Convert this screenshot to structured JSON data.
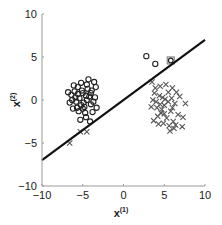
{
  "chart_data": {
    "type": "scatter",
    "title": "",
    "xlabel": "x(1)",
    "ylabel": "x(2)",
    "xlabel_base": "x",
    "xlabel_sup": "(1)",
    "ylabel_base": "x",
    "ylabel_sup": "(2)",
    "xlim": [
      -10,
      10
    ],
    "ylim": [
      -10,
      10
    ],
    "xticks": [
      -10,
      -5,
      0,
      5,
      10
    ],
    "yticks": [
      -10,
      -5,
      0,
      5,
      10
    ],
    "xtick_labels": [
      "−10",
      "−5",
      "0",
      "5",
      "10"
    ],
    "ytick_labels": [
      "−10",
      "−5",
      "0",
      "5",
      "10"
    ],
    "grid": false,
    "legend": null,
    "series": [
      {
        "name": "class-circle",
        "marker": "o",
        "color": "#222222",
        "center": [
          -5,
          0
        ],
        "points": [
          [
            -5.2,
            2.0
          ],
          [
            -6.4,
            0.6
          ],
          [
            -3.6,
            2.1
          ],
          [
            -4.5,
            1.8
          ],
          [
            -5.6,
            1.5
          ],
          [
            -3.9,
            1.1
          ],
          [
            -6.0,
            1.0
          ],
          [
            -4.2,
            0.4
          ],
          [
            -5.8,
            -0.2
          ],
          [
            -6.6,
            -0.3
          ],
          [
            -3.5,
            0.3
          ],
          [
            -4.8,
            -0.8
          ],
          [
            -5.5,
            -1.3
          ],
          [
            -4.0,
            -0.5
          ],
          [
            -6.2,
            -1.0
          ],
          [
            -5.0,
            0.8
          ],
          [
            -4.4,
            1.3
          ],
          [
            -5.9,
            0.3
          ],
          [
            -3.8,
            -1.4
          ],
          [
            -4.6,
            -2.0
          ],
          [
            -5.3,
            -2.3
          ],
          [
            -4.1,
            -2.5
          ],
          [
            -6.3,
            0.0
          ],
          [
            -3.4,
            1.5
          ],
          [
            -5.1,
            1.1
          ],
          [
            -4.7,
            -1.5
          ],
          [
            -5.7,
            -0.9
          ],
          [
            -4.3,
            2.4
          ],
          [
            -6.8,
            0.9
          ],
          [
            -3.7,
            -0.2
          ],
          [
            -5.4,
            0.2
          ],
          [
            -4.9,
            -0.3
          ],
          [
            -5.0,
            -1.0
          ],
          [
            -4.5,
            0.0
          ],
          [
            -5.6,
            0.7
          ],
          [
            -4.0,
            0.8
          ],
          [
            -5.2,
            -0.6
          ],
          [
            -4.6,
            0.5
          ],
          [
            -6.1,
            1.7
          ],
          [
            -3.3,
            -0.9
          ],
          [
            2.8,
            5.1
          ],
          [
            3.9,
            4.2
          ]
        ]
      },
      {
        "name": "class-cross",
        "marker": "x",
        "color": "#555555",
        "center": [
          5,
          -0.5
        ],
        "points": [
          [
            3.5,
            2.1
          ],
          [
            4.5,
            1.6
          ],
          [
            6.0,
            1.4
          ],
          [
            3.8,
            0.8
          ],
          [
            5.5,
            0.9
          ],
          [
            6.9,
            0.4
          ],
          [
            4.0,
            -0.2
          ],
          [
            5.1,
            0.1
          ],
          [
            6.3,
            -0.4
          ],
          [
            3.4,
            -0.8
          ],
          [
            4.7,
            -1.1
          ],
          [
            5.8,
            -1.3
          ],
          [
            6.7,
            -1.7
          ],
          [
            4.2,
            -1.9
          ],
          [
            5.3,
            -2.1
          ],
          [
            3.7,
            -2.4
          ],
          [
            4.9,
            -2.7
          ],
          [
            6.1,
            -2.5
          ],
          [
            5.6,
            -3.0
          ],
          [
            7.3,
            -2.0
          ],
          [
            4.4,
            0.5
          ],
          [
            5.0,
            -0.6
          ],
          [
            4.6,
            -1.5
          ],
          [
            5.9,
            0.2
          ],
          [
            3.9,
            1.4
          ],
          [
            6.5,
            0.9
          ],
          [
            5.2,
            1.8
          ],
          [
            4.1,
            -0.9
          ],
          [
            5.5,
            -0.2
          ],
          [
            4.8,
            0.3
          ],
          [
            6.0,
            -0.9
          ],
          [
            4.3,
            -2.8
          ],
          [
            5.0,
            -1.6
          ],
          [
            3.6,
            0.0
          ],
          [
            6.4,
            -2.9
          ],
          [
            7.6,
            -0.4
          ],
          [
            5.7,
            -3.6
          ],
          [
            7.2,
            -3.1
          ],
          [
            6.2,
            -3.3
          ],
          [
            4.5,
            -0.5
          ],
          [
            -5.3,
            -3.7
          ],
          [
            -4.5,
            -3.7
          ],
          [
            -6.6,
            -5.0
          ]
        ]
      },
      {
        "name": "highlighted-point",
        "marker": "square",
        "color": "#888888",
        "points": [
          [
            5.8,
            4.6
          ]
        ]
      }
    ],
    "decision_boundary": {
      "type": "line",
      "color": "#111111",
      "x": [
        -10,
        10
      ],
      "y": [
        -7.0,
        7.0
      ]
    }
  }
}
